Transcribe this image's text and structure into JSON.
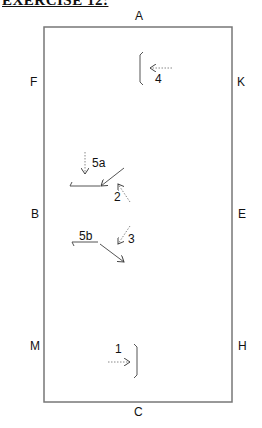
{
  "title": "EXERCISE 12:",
  "arena": {
    "letters": {
      "A": "A",
      "K": "K",
      "E": "E",
      "H": "H",
      "C": "C",
      "M": "M",
      "B": "B",
      "F": "F"
    },
    "border_color": "#777777"
  },
  "movements": [
    {
      "id": "1",
      "label": "1"
    },
    {
      "id": "2",
      "label": "2"
    },
    {
      "id": "3",
      "label": "3"
    },
    {
      "id": "4",
      "label": "4"
    },
    {
      "id": "5a",
      "label": "5a"
    },
    {
      "id": "5b",
      "label": "5b"
    }
  ]
}
